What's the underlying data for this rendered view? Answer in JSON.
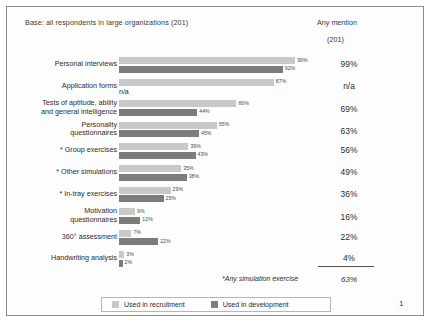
{
  "header": {
    "base_note": "Base: all respondents in large organizations (201)",
    "any_mention_title": "Any mention",
    "any_mention_base": "(201)"
  },
  "legend": {
    "recruitment_label": "Used in recruitment",
    "development_label": "Used in development",
    "recruitment_color": "#c9c9c9",
    "development_color": "#7c7c7c"
  },
  "footer": {
    "footnote": "*Any simulation exercise",
    "footnote_value": "63%",
    "page_number": "1"
  },
  "chart_data": {
    "type": "bar",
    "title": "",
    "subtitle": "Base: all respondents in large organizations (201)",
    "xlabel": "",
    "ylabel": "",
    "xlim": [
      0,
      100
    ],
    "grid": false,
    "legend_position": "bottom",
    "orientation": "horizontal",
    "categories": [
      "Personal interviews",
      "Application forms",
      "Tests of aptitude, ability and general intelligence",
      "Personality questionnaires",
      "* Group exercises",
      "* Other simulations",
      "* In-tray exercises",
      "Motivation questionnaires",
      "360° assessment",
      "Handwriting analysis"
    ],
    "series": [
      {
        "name": "Used in recruitment",
        "color": "#c9c9c9",
        "values": [
          99,
          87,
          66,
          55,
          39,
          35,
          29,
          9,
          7,
          3
        ],
        "labels": [
          "99%",
          "87%",
          "66%",
          "55%",
          "39%",
          "35%",
          "29%",
          "9%",
          "7%",
          "3%"
        ]
      },
      {
        "name": "Used in development",
        "color": "#7c7c7c",
        "values": [
          92,
          null,
          44,
          45,
          43,
          38,
          25,
          12,
          22,
          2
        ],
        "labels": [
          "92%",
          "n/a",
          "44%",
          "45%",
          "43%",
          "38%",
          "25%",
          "12%",
          "22%",
          "2%"
        ]
      }
    ],
    "any_mention": [
      "99%",
      "n/a",
      "69%",
      "63%",
      "56%",
      "49%",
      "36%",
      "16%",
      "22%",
      "4%"
    ]
  },
  "rows": [
    {
      "label_line1": "Personal interviews",
      "label_line2": "",
      "light_value": "99%",
      "dark_value": "92%",
      "mention": "99%"
    },
    {
      "label_line1": "Application forms",
      "label_line2": "",
      "light_value": "87%",
      "dark_value": "n/a",
      "mention": "n/a"
    },
    {
      "label_line1": "Tests of aptitude, ability",
      "label_line2": "and general intelligence",
      "light_value": "66%",
      "dark_value": "44%",
      "mention": "69%"
    },
    {
      "label_line1": "Personality",
      "label_line2": "questionnaires",
      "light_value": "55%",
      "dark_value": "45%",
      "mention": "63%"
    },
    {
      "label_line1": "* Group exercises",
      "label_line2": "",
      "light_value": "39%",
      "dark_value": "43%",
      "mention": "56%"
    },
    {
      "label_line1": "* Other simulations",
      "label_line2": "",
      "light_value": "35%",
      "dark_value": "38%",
      "mention": "49%"
    },
    {
      "label_line1": "* In-tray exercises",
      "label_line2": "",
      "light_value": "29%",
      "dark_value": "25%",
      "mention": "36%"
    },
    {
      "label_line1": "Motivation",
      "label_line2": "questionnaires",
      "light_value": "9%",
      "dark_value": "12%",
      "mention": "16%"
    },
    {
      "label_line1": "360° assessment",
      "label_line2": "",
      "light_value": "7%",
      "dark_value": "22%",
      "mention": "22%"
    },
    {
      "label_line1": "Handwriting analysis",
      "label_line2": "",
      "light_value": "3%",
      "dark_value": "2%",
      "mention": "4%"
    }
  ]
}
